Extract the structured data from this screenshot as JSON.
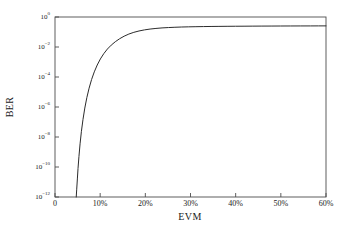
{
  "chart_data": {
    "type": "line",
    "title": "",
    "xlabel": "EVM",
    "ylabel": "BER",
    "xlim": [
      0,
      60
    ],
    "ylim_log10": [
      -12,
      0
    ],
    "yscale": "log",
    "xscale": "linear",
    "grid": false,
    "legend": null,
    "x_unit": "%",
    "xticks": [
      0,
      10,
      20,
      30,
      40,
      50,
      60
    ],
    "xticklabels": [
      "0",
      "10%",
      "20%",
      "30%",
      "40%",
      "50%",
      "60%"
    ],
    "yticks_exponent": [
      0,
      -2,
      -4,
      -6,
      -8,
      -10,
      -12
    ],
    "yticklabels": [
      "10 0",
      "10 -2",
      "10 -4",
      "10 -6",
      "10 -8",
      "10 -10",
      "10 -12"
    ],
    "series": [
      {
        "name": "BER vs EVM",
        "color": "#2b2b2b",
        "linewidth": 1,
        "x": [
          4.7,
          4.8,
          4.95,
          5.1,
          5.3,
          5.55,
          5.85,
          6.2,
          6.6,
          7.05,
          7.55,
          8.1,
          8.7,
          9.35,
          10.05,
          10.8,
          11.6,
          12.45,
          13.35,
          14.3,
          15.3,
          16.35,
          17.45,
          18.6,
          19.8,
          21.05,
          22.35,
          23.7,
          25.1,
          26.55,
          28.05,
          29.6,
          31.2,
          32.85,
          34.55,
          36.3,
          38.1,
          39.95,
          41.85,
          43.8,
          45.8,
          47.85,
          49.95,
          52.1,
          54.3,
          56.55,
          58.3,
          60.0
        ],
        "y": [
          1e-12,
          3e-12,
          1.6e-11,
          8e-11,
          5e-10,
          3.5e-09,
          2.4e-08,
          1.5e-07,
          8.5e-07,
          4.2e-06,
          1.8e-05,
          6.8e-05,
          0.00022,
          0.00063,
          0.0016,
          0.0036,
          0.0073,
          0.0133,
          0.0225,
          0.0355,
          0.0525,
          0.073,
          0.095,
          0.117,
          0.138,
          0.157,
          0.173,
          0.187,
          0.198,
          0.207,
          0.215,
          0.221,
          0.226,
          0.23,
          0.234,
          0.237,
          0.24,
          0.242,
          0.244,
          0.246,
          0.248,
          0.249,
          0.251,
          0.252,
          0.253,
          0.254,
          0.255,
          0.256
        ]
      }
    ]
  },
  "axes": {
    "frame_color": "#4d4d4d",
    "background": "#ffffff"
  }
}
